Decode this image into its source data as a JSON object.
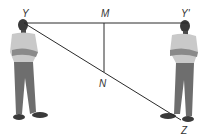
{
  "diagram": {
    "labels": {
      "Y": "Y",
      "M": "M",
      "Y_prime": "Y'",
      "N": "N",
      "Z": "Z"
    },
    "colors": {
      "line": "#2a2a2a",
      "shirt": "#c9c9c9",
      "pants": "#6e6e6e",
      "skin": "#3a3a3a"
    }
  }
}
